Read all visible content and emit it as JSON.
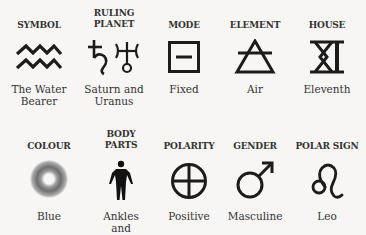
{
  "row1": [
    {
      "label": "SYMBOL",
      "icon": "aquarius-waves-icon",
      "value": "The Water Bearer"
    },
    {
      "label": "RULING PLANET",
      "icon": "saturn-uranus-icon",
      "value": "Saturn and Uranus"
    },
    {
      "label": "MODE",
      "icon": "fixed-mode-square-icon",
      "value": "Fixed"
    },
    {
      "label": "ELEMENT",
      "icon": "air-element-triangle-icon",
      "value": "Air"
    },
    {
      "label": "HOUSE",
      "icon": "roman-eleven-icon",
      "value": "Eleventh"
    }
  ],
  "row2": [
    {
      "label": "COLOUR",
      "icon": "blue-swirl-icon",
      "value": "Blue"
    },
    {
      "label": "BODY PARTS",
      "icon": "human-figure-icon",
      "value": "Ankles and Circulation"
    },
    {
      "label": "POLARITY",
      "icon": "positive-circle-plus-icon",
      "value": "Positive"
    },
    {
      "label": "GENDER",
      "icon": "male-symbol-icon",
      "value": "Masculine"
    },
    {
      "label": "POLAR SIGN",
      "icon": "leo-symbol-icon",
      "value": "Leo"
    }
  ]
}
